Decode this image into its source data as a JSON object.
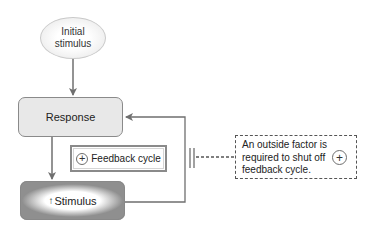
{
  "diagram": {
    "type": "positive-feedback-loop",
    "nodes": {
      "initial_stimulus": {
        "line1": "Initial",
        "line2": "stimulus",
        "shape": "oval"
      },
      "response": {
        "label": "Response",
        "shape": "rounded-rectangle"
      },
      "stimulus": {
        "arrow_glyph": "↑",
        "label": "Stimulus",
        "shape": "rounded-rectangle-gradient"
      }
    },
    "feedback_label": {
      "symbol": "+",
      "label": "Feedback cycle"
    },
    "note": {
      "lines": [
        "An outside factor is",
        "required to shut off",
        "feedback cycle."
      ],
      "symbol": "+"
    },
    "edges": [
      {
        "from": "initial_stimulus",
        "to": "response"
      },
      {
        "from": "response",
        "to": "stimulus"
      },
      {
        "from": "stimulus",
        "to": "response",
        "label": "feedback loop"
      }
    ],
    "colors": {
      "line": "#6f6f6f",
      "box_fill": "#e8e8e8",
      "border": "#8a8a8a"
    }
  }
}
